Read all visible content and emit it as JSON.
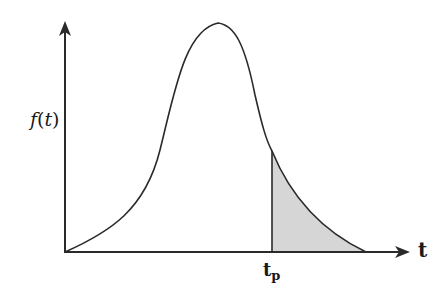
{
  "diagram": {
    "type": "probability-density-curve",
    "y_axis_label": {
      "func": "f",
      "open": "(",
      "var": "t",
      "close": ")"
    },
    "x_axis_label": "t",
    "marker_label": {
      "base": "t",
      "sub": "p"
    },
    "colors": {
      "stroke": "#2a2a2a",
      "shade": "#d6d6d6",
      "background": "#ffffff"
    },
    "shaded_region": "area under curve for t > t_p"
  }
}
